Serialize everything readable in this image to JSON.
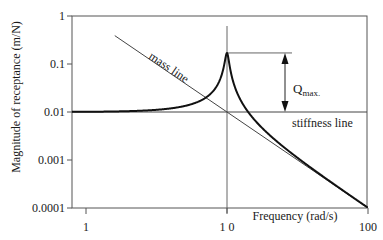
{
  "chart_data": {
    "type": "line",
    "title": "",
    "xlabel": "Frequency (rad/s)",
    "ylabel": "Magnitude of receptance (m/N)",
    "xscale": "log",
    "yscale": "log",
    "xlim": [
      1,
      100
    ],
    "ylim": [
      0.0001,
      1
    ],
    "x_ticks": [
      1,
      10,
      100
    ],
    "x_tick_labels": [
      "1",
      "1 0",
      "100"
    ],
    "y_ticks": [
      1,
      0.1,
      0.01,
      0.001,
      0.0001
    ],
    "y_tick_labels": [
      "1",
      "0.1",
      "0.01",
      "0.001",
      "0.0001"
    ],
    "grid": false,
    "legend": null,
    "series": [
      {
        "name": "receptance",
        "description": "Single-degree-of-freedom receptance magnitude",
        "natural_frequency": 10,
        "static_receptance": 0.01,
        "peak_value": 0.17,
        "x": [
          1,
          2,
          3,
          5,
          7,
          8,
          9,
          9.5,
          10,
          10.5,
          11,
          12,
          15,
          20,
          30,
          50,
          70,
          100
        ],
        "values": [
          0.0101,
          0.0104,
          0.011,
          0.0133,
          0.0196,
          0.0277,
          0.0524,
          0.096,
          0.17,
          0.094,
          0.0474,
          0.0227,
          0.008,
          0.00333,
          0.00125,
          0.000417,
          0.000208,
          0.000101
        ]
      },
      {
        "name": "mass line",
        "x": [
          1.6,
          10,
          100
        ],
        "values": [
          0.39,
          0.01,
          0.0001
        ]
      },
      {
        "name": "stiffness line",
        "x": [
          1,
          100
        ],
        "values": [
          0.01,
          0.01
        ]
      }
    ],
    "annotations": [
      {
        "text": "mass line",
        "x": 2.2,
        "y": 0.2
      },
      {
        "text": "stiffness line",
        "x": 30,
        "y": 0.006
      },
      {
        "text": "Q",
        "subscript": "max.",
        "x": 14,
        "y": 0.04,
        "arrow_from": 0.17,
        "arrow_to": 0.01
      }
    ],
    "reference_lines": [
      {
        "orientation": "vertical",
        "x": 10
      },
      {
        "orientation": "horizontal",
        "y": 0.17,
        "x_from": 10,
        "x_to": 14
      }
    ]
  },
  "labels": {
    "ylabel": "Magnitude of receptance (m/N)",
    "xlabel": "Frequency (rad/s)",
    "mass_line": "mass line",
    "stiffness_line": "stiffness line",
    "q_main": "Q",
    "q_sub": "max."
  }
}
